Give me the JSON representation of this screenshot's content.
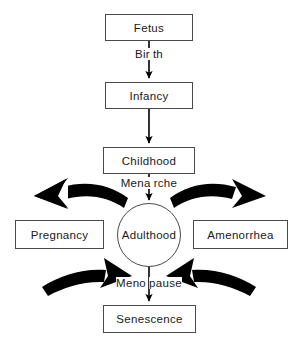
{
  "diagram": {
    "background_color": "#ffffff",
    "stroke_color": "#000000",
    "box_border_color": "#4a4a4a",
    "text_color": "#1a1a1a",
    "nodes": {
      "fetus": "Fetus",
      "infancy": "Infancy",
      "childhood": "Childhood",
      "pregnancy": "Pregnancy",
      "adulthood": "Adulthood",
      "amenorrhea": "Amenorrhea",
      "senescence": "Senescence"
    },
    "edge_labels": {
      "birth": {
        "full": "Birth",
        "left": "Bir",
        "right": "th"
      },
      "menarche": {
        "full": "Menarche",
        "left": "Mena",
        "right": "rche"
      },
      "menopause": {
        "full": "Menopause",
        "left": "Meno",
        "right": "pause"
      }
    },
    "flow_sequence": [
      "Fetus",
      "Infancy",
      "Childhood",
      "Adulthood",
      "Senescence"
    ],
    "branches": [
      {
        "from": "Adulthood",
        "to": "Pregnancy",
        "style": "curved-thick"
      },
      {
        "from": "Adulthood",
        "to": "Amenorrhea",
        "style": "curved-thick"
      },
      {
        "from": "Pregnancy",
        "to": "Adulthood",
        "style": "curved-thick"
      },
      {
        "from": "Amenorrhea",
        "to": "Adulthood",
        "style": "curved-thick"
      }
    ]
  }
}
